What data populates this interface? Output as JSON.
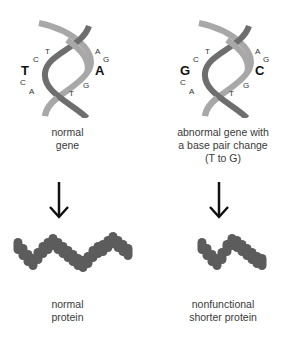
{
  "panels": [
    {
      "id": "normal",
      "helix": {
        "left_letters": [
          "T",
          "C",
          "T",
          "C",
          "A"
        ],
        "highlight_left": "T",
        "right_letters": [
          "A",
          "G",
          "A",
          "G",
          "T"
        ],
        "highlight_right": "A",
        "left_labels": {
          "t_top": "T",
          "c_top": "C",
          "big": "T",
          "c_bot": "C",
          "a_bot": "A"
        },
        "right_labels": {
          "a_top": "A",
          "g_top": "G",
          "big": "A",
          "g_bot": "G",
          "t_bot": "T"
        }
      },
      "gene_caption": [
        "normal",
        "gene"
      ],
      "protein_caption": [
        "normal",
        "protein"
      ],
      "protein_length": "full"
    },
    {
      "id": "abnormal",
      "helix": {
        "left_labels": {
          "t_top": "T",
          "c_top": "C",
          "big": "G",
          "c_bot": "C",
          "a_bot": "A"
        },
        "right_labels": {
          "a_top": "A",
          "g_top": "G",
          "big": "C",
          "g_bot": "G",
          "t_bot": "T"
        }
      },
      "gene_caption": [
        "abnormal gene with",
        "a base pair change",
        "(T to G)"
      ],
      "protein_caption": [
        "nonfunctional",
        "shorter protein"
      ],
      "protein_length": "shorter"
    }
  ],
  "colors": {
    "strand_dark": "#6e6e6e",
    "strand_light": "#a8a8a8",
    "protein": "#5c5c5c",
    "arrow": "#111111",
    "text": "#3a3a3a",
    "bold_letter": "#111111"
  }
}
